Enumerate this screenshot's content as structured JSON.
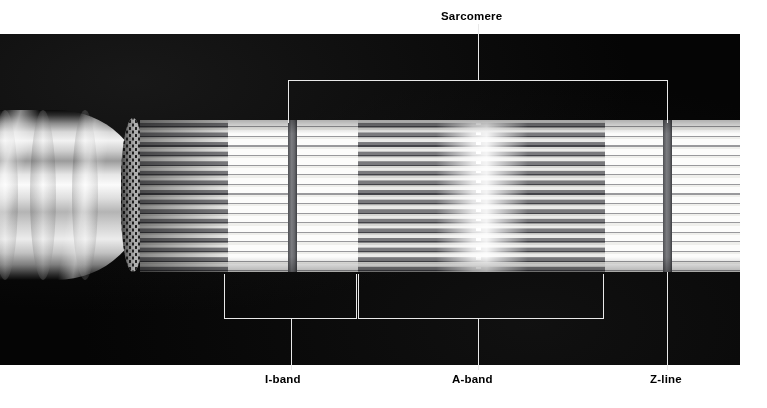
{
  "figure": {
    "background_color": "#050505",
    "line_color": "#e9e9e9",
    "label_color": "#000000"
  },
  "labels": {
    "sarcomere": "Sarcomere",
    "i_band": "I-band",
    "a_band": "A-band",
    "z_line": "Z-line"
  },
  "structures": {
    "muscle_fiber": "muscle-fiber-cylinder",
    "cross_section": "myofibril-cross-section",
    "myofibril": "myofibril-slab",
    "z_lines": [
      292,
      667
    ],
    "m_line": 478,
    "a_bands": [
      [
        140,
        228
      ],
      [
        358,
        605
      ]
    ],
    "i_bands": [
      [
        228,
        292
      ],
      [
        296,
        358
      ],
      [
        605,
        663
      ],
      [
        672,
        740
      ]
    ],
    "row_count": 16
  },
  "brackets": {
    "sarcomere": {
      "left": 288,
      "right": 667,
      "y": 80,
      "drop": 43,
      "tick_x": 478,
      "tick_top": 24
    },
    "i_band": {
      "left": 224,
      "right": 356,
      "y": 318,
      "tick_x": 291,
      "tick_bottom": 370
    },
    "a_band": {
      "left": 358,
      "right": 603,
      "y": 318,
      "tick_x": 478,
      "tick_bottom": 370
    },
    "z_line": {
      "tick_x": 667,
      "top": 272,
      "bottom": 370
    }
  }
}
